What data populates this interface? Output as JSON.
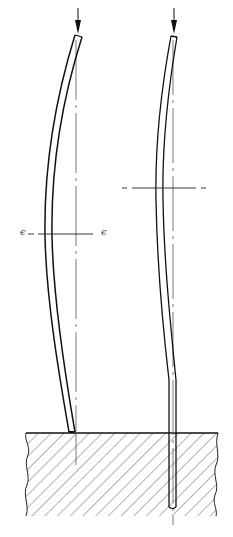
{
  "diagram": {
    "columns": [
      {
        "id": "left",
        "support": "pinned on surface",
        "load": "axial compressive force (arrow)",
        "section_label_left": "ϵ",
        "section_label_right": "ϵ"
      },
      {
        "id": "right",
        "support": "embedded in ground",
        "load": "axial compressive force (arrow)"
      }
    ],
    "colors": {
      "ink": "#111111",
      "centerline": "#555555",
      "hatch": "#666666",
      "background": "#ffffff"
    }
  }
}
